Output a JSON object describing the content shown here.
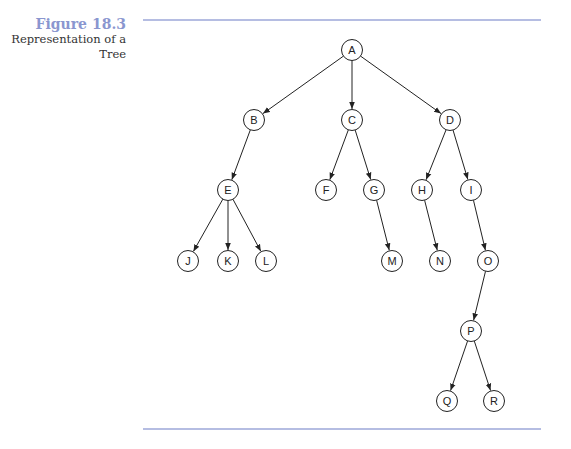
{
  "caption": {
    "figure_number": "Figure 18.3",
    "title_line1": "Representation of a",
    "title_line2": "Tree"
  },
  "tree": {
    "nodes": [
      {
        "id": "A",
        "x": 352,
        "y": 50
      },
      {
        "id": "B",
        "x": 254,
        "y": 120
      },
      {
        "id": "C",
        "x": 352,
        "y": 120
      },
      {
        "id": "D",
        "x": 450,
        "y": 120
      },
      {
        "id": "E",
        "x": 228,
        "y": 190
      },
      {
        "id": "F",
        "x": 326,
        "y": 190
      },
      {
        "id": "G",
        "x": 374,
        "y": 190
      },
      {
        "id": "H",
        "x": 422,
        "y": 190
      },
      {
        "id": "I",
        "x": 471,
        "y": 190
      },
      {
        "id": "J",
        "x": 188,
        "y": 261
      },
      {
        "id": "K",
        "x": 228,
        "y": 261
      },
      {
        "id": "L",
        "x": 266,
        "y": 261
      },
      {
        "id": "M",
        "x": 392,
        "y": 261
      },
      {
        "id": "N",
        "x": 440,
        "y": 261
      },
      {
        "id": "O",
        "x": 488,
        "y": 261
      },
      {
        "id": "P",
        "x": 471,
        "y": 331
      },
      {
        "id": "Q",
        "x": 447,
        "y": 401
      },
      {
        "id": "R",
        "x": 494,
        "y": 401
      }
    ],
    "edges": [
      [
        "A",
        "B"
      ],
      [
        "A",
        "C"
      ],
      [
        "A",
        "D"
      ],
      [
        "B",
        "E"
      ],
      [
        "C",
        "F"
      ],
      [
        "C",
        "G"
      ],
      [
        "D",
        "H"
      ],
      [
        "D",
        "I"
      ],
      [
        "E",
        "J"
      ],
      [
        "E",
        "K"
      ],
      [
        "E",
        "L"
      ],
      [
        "G",
        "M"
      ],
      [
        "H",
        "N"
      ],
      [
        "I",
        "O"
      ],
      [
        "O",
        "P"
      ],
      [
        "P",
        "Q"
      ],
      [
        "P",
        "R"
      ]
    ]
  }
}
